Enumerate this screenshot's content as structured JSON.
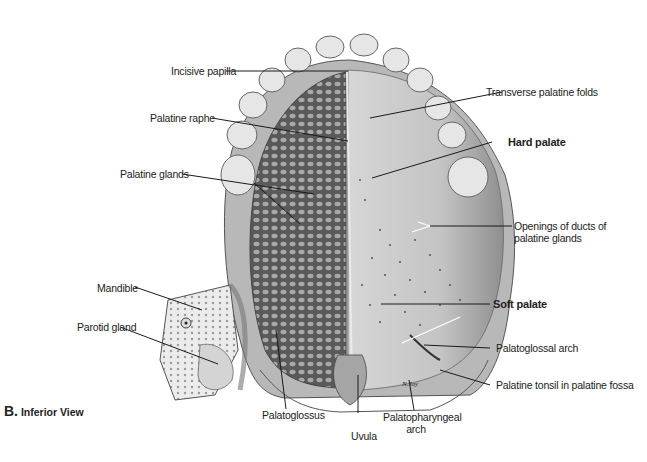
{
  "figure": {
    "panel_letter": "B.",
    "panel_title": "Inferior View",
    "signature": "N.Joy",
    "illustration": "hard-and-soft-palate-inferior-view",
    "colors": {
      "ink": "#222222",
      "line": "#1a1a1a",
      "background": "#ffffff",
      "tooth": "#e4e4e4",
      "gland": "#8a8a8a",
      "mucosa": "#c8c8c8",
      "bone": "#eeeeee"
    }
  },
  "labels": {
    "incisive_papilla": "Incisive papilla",
    "palatine_raphe": "Palatine raphe",
    "palatine_glands": "Palatine glands",
    "mandible": "Mandible",
    "parotid_gland": "Parotid gland",
    "palatoglossus": "Palatoglossus",
    "uvula": "Uvula",
    "palatopharyngeal_arch_line1": "Palatopharyngeal",
    "palatopharyngeal_arch_line2": "arch",
    "transverse_palatine_folds": "Transverse palatine folds",
    "hard_palate": "Hard palate",
    "openings_ducts_line1": "Openings of ducts of",
    "openings_ducts_line2": "palatine glands",
    "soft_palate": "Soft palate",
    "palatoglossal_arch": "Palatoglossal arch",
    "palatine_tonsil": "Palatine tonsil in palatine fossa"
  }
}
